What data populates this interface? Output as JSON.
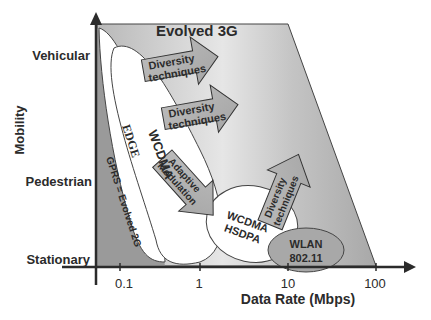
{
  "diagram": {
    "title": "Evolved 3G",
    "y_axis": {
      "label": "Mobility",
      "ticks": [
        "Vehicular",
        "Pedestrian",
        "Stationary"
      ]
    },
    "x_axis": {
      "label": "Data Rate (Mbps)",
      "ticks": [
        "0.1",
        "1",
        "10",
        "100"
      ]
    },
    "regions": {
      "gprs": "GPRS = Evolved 2G",
      "edge": "EDGE",
      "wcdma": "WCDMA",
      "hsdpa_line1": "WCDMA",
      "hsdpa_line2": "HSDPA",
      "wlan_line1": "WLAN",
      "wlan_line2": "802.11"
    },
    "arrows": [
      {
        "line1": "Diversity",
        "line2": "techniques"
      },
      {
        "line1": "Diversity",
        "line2": "techniques"
      },
      {
        "line1": "Adaptive",
        "line2": "Modulation"
      },
      {
        "line1": "Diversity",
        "line2": "techniques"
      }
    ]
  }
}
